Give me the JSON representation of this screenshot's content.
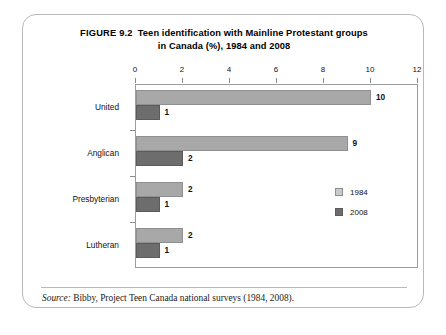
{
  "figure": {
    "number_label": "FIGURE 9.2",
    "title_line1": "Teen identification with Mainline Protestant groups",
    "title_line2": "in Canada (%), 1984 and 2008",
    "source_label": "Source:",
    "source_text": " Bibby, Project Teen Canada national surveys (1984, 2008)."
  },
  "colors": {
    "series_1984": "#a8a8a8",
    "series_2008": "#6d6d6d",
    "frame": "#b9b9b9",
    "axis": "#9c9c9c"
  },
  "legend": {
    "position": "inside-right",
    "entries": [
      {
        "label": "1984",
        "color": "#c9c9c9"
      },
      {
        "label": "2008",
        "color": "#6d6d6d"
      }
    ]
  },
  "chart_data": {
    "type": "bar",
    "orientation": "horizontal",
    "subtitle": "",
    "xlabel": "",
    "ylabel": "",
    "xlim": [
      0,
      12
    ],
    "xticks": [
      0,
      2,
      4,
      6,
      8,
      10,
      12
    ],
    "xtick_labels": [
      "0",
      "2",
      "4",
      "6",
      "8",
      "10",
      "12"
    ],
    "grid": false,
    "axis_position": "top",
    "categories": [
      "United",
      "Anglican",
      "Presbyterian",
      "Lutheran"
    ],
    "series": [
      {
        "name": "1984",
        "values": [
          10,
          9,
          2,
          2
        ],
        "color": "#a8a8a8"
      },
      {
        "name": "2008",
        "values": [
          1,
          2,
          1,
          1
        ],
        "color": "#6d6d6d"
      }
    ],
    "data_labels": {
      "1984": [
        "10",
        "9",
        "2",
        "2"
      ],
      "2008": [
        "1",
        "2",
        "1",
        "1"
      ]
    },
    "units": "percent",
    "source": "Bibby, Project Teen Canada national surveys (1984, 2008)."
  }
}
